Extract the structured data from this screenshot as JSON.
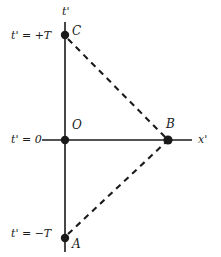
{
  "figure": {
    "type": "minkowski-spacetime-diagram",
    "background_color": "#ffffff",
    "ink_color": "#1a1a1a"
  },
  "axes": {
    "vertical": {
      "name": "t'",
      "label": "t'"
    },
    "horizontal": {
      "name": "x'",
      "label": "x'"
    }
  },
  "tick_labels": [
    {
      "id": "t-plus-T",
      "text": "t' = +T"
    },
    {
      "id": "t-zero",
      "text": "t' = 0"
    },
    {
      "id": "t-minus-T",
      "text": "t' = −T"
    }
  ],
  "points": [
    {
      "id": "C",
      "label": "C",
      "x": 65,
      "y": 35,
      "note": "on t' axis at t' = +T"
    },
    {
      "id": "O",
      "label": "O",
      "x": 65,
      "y": 140,
      "note": "origin, t' = 0"
    },
    {
      "id": "B",
      "label": "B",
      "x": 168,
      "y": 140,
      "note": "on x' axis"
    },
    {
      "id": "A",
      "label": "A",
      "x": 65,
      "y": 238,
      "note": "on t' axis at t' = −T"
    }
  ],
  "solid_lines": [
    {
      "id": "t-axis",
      "x1": 65,
      "y1": 22,
      "x2": 65,
      "y2": 252
    },
    {
      "id": "x-axis",
      "x1": 42,
      "y1": 140,
      "x2": 192,
      "y2": 140
    }
  ],
  "dashed_lines": [
    {
      "id": "C-to-B",
      "from": "C",
      "to": "B",
      "x1": 68,
      "y1": 39,
      "x2": 166,
      "y2": 138
    },
    {
      "id": "A-to-B",
      "from": "A",
      "to": "B",
      "x1": 68,
      "y1": 234,
      "x2": 166,
      "y2": 142
    }
  ],
  "chart_data": {
    "type": "scatter",
    "title": "",
    "xlabel": "x'",
    "ylabel": "t'",
    "grid": false,
    "legend": null,
    "categories": [
      "A",
      "B",
      "C",
      "O"
    ],
    "series": [
      {
        "name": "events",
        "points": [
          {
            "label": "C",
            "x": 0,
            "y": 1,
            "tick": "t' = +T"
          },
          {
            "label": "O",
            "x": 0,
            "y": 0,
            "tick": "t' = 0"
          },
          {
            "label": "B",
            "x": 1,
            "y": 0,
            "tick": ""
          },
          {
            "label": "A",
            "x": 0,
            "y": -1,
            "tick": "t' = −T"
          }
        ]
      }
    ],
    "annotations": [
      {
        "text": "t' = +T",
        "target": "C"
      },
      {
        "text": "t' = 0",
        "target": "O"
      },
      {
        "text": "t' = −T",
        "target": "A"
      }
    ],
    "connections": [
      {
        "style": "dashed",
        "from": "C",
        "to": "B"
      },
      {
        "style": "dashed",
        "from": "A",
        "to": "B"
      }
    ],
    "xlim": [
      -0.25,
      1.55
    ],
    "ylim": [
      -1.25,
      1.25
    ]
  }
}
